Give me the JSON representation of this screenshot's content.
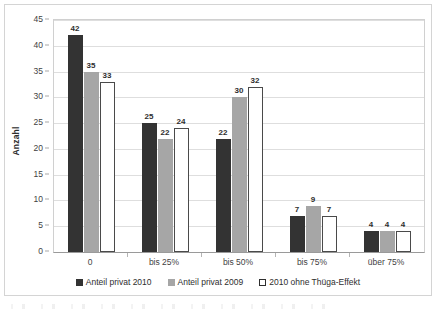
{
  "chart_data": {
    "type": "bar",
    "title": "",
    "xlabel": "",
    "ylabel": "Anzahl",
    "ylim": [
      0,
      45
    ],
    "ytick_step": 5,
    "yticks": [
      0,
      5,
      10,
      15,
      20,
      25,
      30,
      35,
      40,
      45
    ],
    "grid": true,
    "legend_position": "bottom",
    "categories": [
      "0",
      "bis 25%",
      "bis 50%",
      "bis 75%",
      "über 75%"
    ],
    "series": [
      {
        "name": "Anteil privat 2010",
        "color": "#333333",
        "values": [
          42,
          25,
          22,
          7,
          4
        ]
      },
      {
        "name": "Anteil privat 2009",
        "color": "#a6a6a6",
        "values": [
          35,
          22,
          30,
          9,
          4
        ]
      },
      {
        "name": "2010 ohne Thüga-Effekt",
        "color": "#ffffff",
        "border_color": "#4a4a4a",
        "values": [
          33,
          24,
          32,
          7,
          4
        ]
      }
    ]
  }
}
